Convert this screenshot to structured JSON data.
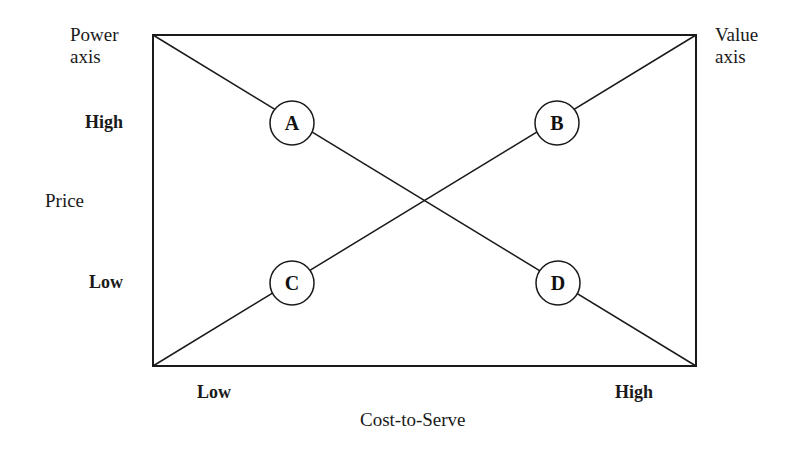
{
  "figure": {
    "type": "2x2-matrix-diagram",
    "background_color": "#ffffff",
    "line_color": "#1a1a1a"
  },
  "axes": {
    "vertical_title": "Price",
    "vertical_high": "High",
    "vertical_low": "Low",
    "horizontal_title": "Cost-to-Serve",
    "horizontal_low": "Low",
    "horizontal_high": "High"
  },
  "corner_annotations": {
    "top_left": "Power\naxis",
    "top_left_line1": "Power",
    "top_left_line2": "axis",
    "top_right": "Value\naxis",
    "top_right_line1": "Value",
    "top_right_line2": "axis"
  },
  "frame": {
    "x": 153,
    "y": 35,
    "width": 543,
    "height": 331,
    "stroke_width": 2
  },
  "diagonals": [
    {
      "name": "power-axis-diagonal",
      "from": [
        153,
        35
      ],
      "to": [
        696,
        366
      ],
      "stroke_width": 1.5
    },
    {
      "name": "value-axis-diagonal",
      "from": [
        153,
        366
      ],
      "to": [
        696,
        35
      ],
      "stroke_width": 1.5
    }
  ],
  "nodes": [
    {
      "id": "A",
      "label": "A",
      "cx": 292,
      "cy": 123,
      "r": 22,
      "quadrant": "high-price / low-cost-to-serve"
    },
    {
      "id": "B",
      "label": "B",
      "cx": 557,
      "cy": 123,
      "r": 22,
      "quadrant": "high-price / high-cost-to-serve"
    },
    {
      "id": "C",
      "label": "C",
      "cx": 292,
      "cy": 283,
      "r": 22,
      "quadrant": "low-price / low-cost-to-serve"
    },
    {
      "id": "D",
      "label": "D",
      "cx": 558,
      "cy": 283,
      "r": 22,
      "quadrant": "low-price / high-cost-to-serve"
    }
  ]
}
